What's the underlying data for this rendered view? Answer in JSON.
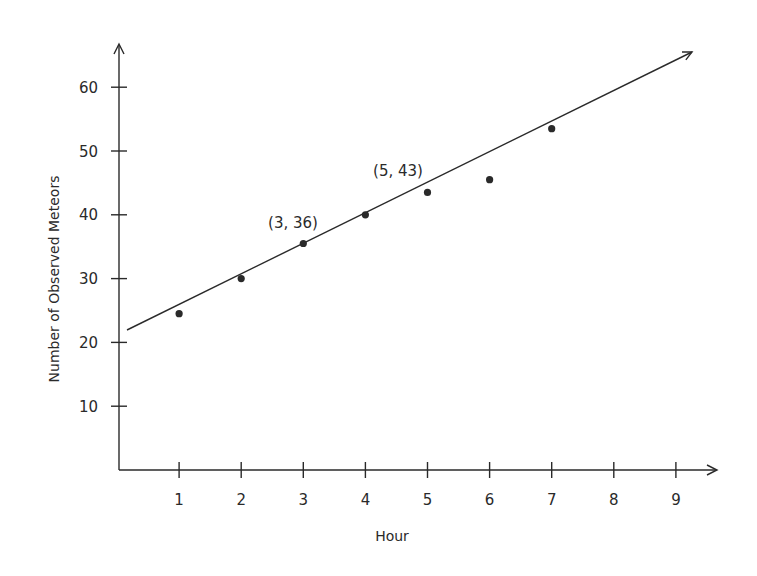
{
  "chart_data": {
    "type": "scatter",
    "title": "",
    "xlabel": "Hour",
    "ylabel": "Number of Observed Meteors",
    "xlim": [
      0,
      9.4
    ],
    "ylim": [
      0,
      65
    ],
    "x_ticks": [
      1,
      2,
      3,
      4,
      5,
      6,
      7,
      8,
      9
    ],
    "y_ticks": [
      10,
      20,
      30,
      40,
      50,
      60
    ],
    "grid": false,
    "legend": null,
    "series": [
      {
        "name": "Observed meteors",
        "type": "scatter",
        "points": [
          {
            "x": 1,
            "y": 24.5
          },
          {
            "x": 2,
            "y": 30
          },
          {
            "x": 3,
            "y": 35.5
          },
          {
            "x": 4,
            "y": 40
          },
          {
            "x": 5,
            "y": 43.5
          },
          {
            "x": 6,
            "y": 45.5
          },
          {
            "x": 7,
            "y": 53.5
          }
        ]
      },
      {
        "name": "Line of best fit",
        "type": "line",
        "slope": 3.5,
        "intercept": 25.5,
        "x_start": 0.17,
        "x_end": 9.25,
        "arrow_end": true
      }
    ],
    "annotations": [
      {
        "text": "(3, 36)",
        "x": 3,
        "y": 36
      },
      {
        "text": "(5, 43)",
        "x": 5,
        "y": 43
      }
    ]
  },
  "axes": {
    "x_tick_labels": [
      "1",
      "2",
      "3",
      "4",
      "5",
      "6",
      "7",
      "8",
      "9"
    ],
    "y_tick_labels": [
      "10",
      "20",
      "30",
      "40",
      "50",
      "60"
    ]
  },
  "colors": {
    "ink": "#2a2a2a",
    "background": "#ffffff"
  }
}
